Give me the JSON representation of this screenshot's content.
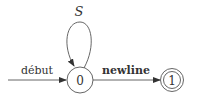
{
  "diagram": {
    "type": "finite-automaton",
    "states": [
      {
        "id": "0",
        "label": "0",
        "accepting": false,
        "initial": true
      },
      {
        "id": "1",
        "label": "1",
        "accepting": true,
        "initial": false
      }
    ],
    "start_edge": {
      "to": "0",
      "label": "début"
    },
    "transitions": [
      {
        "from": "0",
        "to": "0",
        "label": "S",
        "style": "italic",
        "kind": "self-loop"
      },
      {
        "from": "0",
        "to": "1",
        "label": "newline",
        "style": "bold"
      }
    ],
    "colors": {
      "stroke": "#555555",
      "text": "#333333",
      "background": "#ffffff"
    }
  }
}
